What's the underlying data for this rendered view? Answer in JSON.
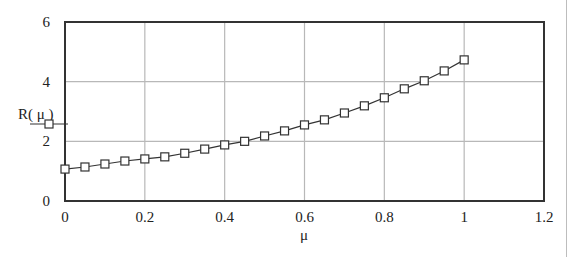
{
  "chart_data": {
    "type": "line",
    "title": "",
    "xlabel": "μ",
    "ylabel": "R( μ )",
    "xlim": [
      0,
      1.2
    ],
    "ylim": [
      0,
      6
    ],
    "x_ticks": [
      "0",
      "0.2",
      "0.4",
      "0.6",
      "0.8",
      "1",
      "1.2"
    ],
    "y_ticks": [
      "0",
      "2",
      "4",
      "6"
    ],
    "grid": true,
    "legend_position": "left of y-axis, below ylabel",
    "series": [
      {
        "name": "R(μ)",
        "marker": "square",
        "color": "#333333",
        "x": [
          0,
          0.05,
          0.1,
          0.15,
          0.2,
          0.25,
          0.3,
          0.35,
          0.4,
          0.45,
          0.5,
          0.55,
          0.6,
          0.65,
          0.7,
          0.75,
          0.8,
          0.85,
          0.9,
          0.95,
          1.0
        ],
        "values": [
          1.07,
          1.14,
          1.24,
          1.34,
          1.41,
          1.48,
          1.6,
          1.74,
          1.88,
          2.0,
          2.18,
          2.35,
          2.55,
          2.72,
          2.95,
          3.19,
          3.46,
          3.76,
          4.03,
          4.36,
          4.73
        ]
      }
    ]
  },
  "labels": {
    "ylabel": "R( μ )",
    "xlabel": "μ"
  },
  "colors": {
    "axis": "#333333",
    "grid": "#b8b8b8",
    "line": "#333333",
    "background": "#ffffff"
  }
}
